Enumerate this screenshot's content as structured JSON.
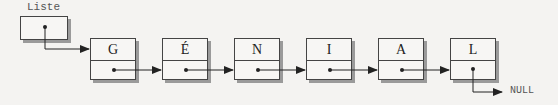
{
  "head": {
    "label": "Liste"
  },
  "nodes": [
    {
      "value": "G"
    },
    {
      "value": "É"
    },
    {
      "value": "N"
    },
    {
      "value": "I"
    },
    {
      "value": "A"
    },
    {
      "value": "L"
    }
  ],
  "terminal": {
    "label": "NULL"
  },
  "colors": {
    "stroke": "#222222",
    "shadow": "#9a9a9a",
    "background": "#f4f3f1"
  }
}
